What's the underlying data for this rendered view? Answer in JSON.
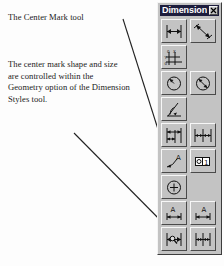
{
  "page": {
    "background_color": "#fdfdfd",
    "callouts": [
      {
        "id": "callout-1",
        "text": "The Center Mark tool"
      },
      {
        "id": "callout-2",
        "text": "The center mark shape and size are controlled within the Geometry option of the Dimension Styles tool."
      }
    ],
    "leader_lines": [
      {
        "name": "leader-line-top",
        "from": [
          123,
          19
        ],
        "to": [
          176,
          186
        ]
      },
      {
        "name": "leader-line-bottom",
        "from": [
          74,
          133
        ],
        "to": [
          173,
          233
        ]
      }
    ]
  },
  "toolbar": {
    "title": "Dimension",
    "close_label": "×",
    "title_bar_color": "#1d1d3d",
    "face_color": "#c3c3c3",
    "buttons": [
      {
        "name": "linear-dimension-button",
        "label": "Linear Dimension"
      },
      {
        "name": "aligned-dimension-button",
        "label": "Aligned Dimension"
      },
      {
        "name": "ordinate-dimension-button",
        "label": "Ordinate Dimension"
      },
      {
        "name": "radius-dimension-button",
        "label": "Radius Dimension"
      },
      {
        "name": "diameter-dimension-button",
        "label": "Diameter Dimension"
      },
      {
        "name": "angular-dimension-button",
        "label": "Angular Dimension"
      },
      {
        "name": "baseline-dimension-button",
        "label": "Baseline Dimension"
      },
      {
        "name": "continue-dimension-button",
        "label": "Continue Dimension"
      },
      {
        "name": "leader-button",
        "label": "Leader"
      },
      {
        "name": "tolerance-button",
        "label": "Tolerance"
      },
      {
        "name": "center-mark-button",
        "label": "Center Mark"
      },
      {
        "name": "dimension-edit-button",
        "label": "Dimension Edit"
      },
      {
        "name": "dimension-text-edit-button",
        "label": "Dimension Text Edit"
      },
      {
        "name": "dimension-update-button",
        "label": "Dimension Update"
      },
      {
        "name": "dimension-style-button",
        "label": "Dimension Style"
      }
    ]
  }
}
